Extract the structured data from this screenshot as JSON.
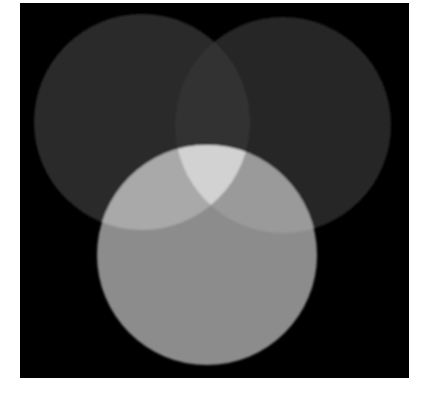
{
  "figure": {
    "background": {
      "x": 20,
      "y": 3,
      "width": 389,
      "height": 375,
      "color": "#000000"
    },
    "circles": [
      {
        "name": "left",
        "cx": 142,
        "cy": 122,
        "r": 108,
        "color": "#2c2c2c"
      },
      {
        "name": "right",
        "cx": 283,
        "cy": 125,
        "r": 108,
        "color": "#262626"
      },
      {
        "name": "bottom",
        "cx": 207,
        "cy": 255,
        "r": 110,
        "color": "#8c8c8c"
      }
    ],
    "overlaps": {
      "left_right": "#333333",
      "bottom_left": "#a9a9a9",
      "bottom_right": "#9a9a9a",
      "all_three": "#d2d2d2"
    }
  }
}
